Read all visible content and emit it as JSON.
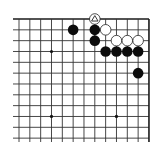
{
  "board": {
    "size": 19,
    "visible_region": "upper-right corner",
    "visible_columns": 13,
    "visible_rows": 12,
    "colors": {
      "line": "#333333",
      "black": "#0c0c0c",
      "white": "#ffffff",
      "background": "#ffffff"
    },
    "star_points": [
      {
        "col": 3,
        "row": 3
      },
      {
        "col": 9,
        "row": 3
      },
      {
        "col": 3,
        "row": 9
      },
      {
        "col": 9,
        "row": 9
      }
    ],
    "stones": [
      {
        "color": "white",
        "col": 7,
        "row": 0,
        "marker": "triangle"
      },
      {
        "color": "black",
        "col": 5,
        "row": 1
      },
      {
        "color": "black",
        "col": 7,
        "row": 1
      },
      {
        "color": "white",
        "col": 8,
        "row": 1
      },
      {
        "color": "black",
        "col": 7,
        "row": 2
      },
      {
        "color": "white",
        "col": 9,
        "row": 2
      },
      {
        "color": "white",
        "col": 10,
        "row": 2
      },
      {
        "color": "white",
        "col": 11,
        "row": 2
      },
      {
        "color": "black",
        "col": 8,
        "row": 3
      },
      {
        "color": "black",
        "col": 9,
        "row": 3
      },
      {
        "color": "black",
        "col": 10,
        "row": 3
      },
      {
        "color": "black",
        "col": 11,
        "row": 3
      },
      {
        "color": "black",
        "col": 11,
        "row": 5
      }
    ]
  }
}
